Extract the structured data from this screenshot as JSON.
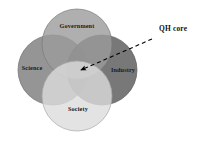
{
  "diagram": {
    "background_color": "#ffffff",
    "center": {
      "x": 77,
      "y": 70
    },
    "circle_radius": 35,
    "circles": [
      {
        "id": "government",
        "label": "Government",
        "position": "top",
        "cx": 77,
        "cy": 44,
        "r": 35,
        "fill": "#9b9b9b",
        "stroke": "#7a7a7a",
        "label_x": 77,
        "label_y": 27
      },
      {
        "id": "science",
        "label": "Science",
        "position": "left",
        "cx": 53,
        "cy": 70,
        "r": 35,
        "fill": "#8c8c8c",
        "stroke": "#6f6f6f",
        "label_x": 32,
        "label_y": 69
      },
      {
        "id": "industry",
        "label": "Industry",
        "position": "right",
        "cx": 102,
        "cy": 70,
        "r": 35,
        "fill": "#6d6d6d",
        "stroke": "#5a5a5a",
        "label_x": 123,
        "label_y": 71
      },
      {
        "id": "society",
        "label": "Society",
        "position": "bottom",
        "cx": 77,
        "cy": 96,
        "r": 35,
        "fill": "#dcdcdc",
        "stroke": "#a8a8a8",
        "label_x": 78,
        "label_y": 110
      }
    ],
    "annotation": {
      "id": "qh-core",
      "label": "QH core",
      "label_x": 159,
      "label_y": 29,
      "line_color": "#000000",
      "line_style": "dashed",
      "line_dash": "4,3",
      "line_width": 1.1,
      "line_start": {
        "x": 152,
        "y": 39
      },
      "line_end": {
        "x": 80,
        "y": 70
      },
      "arrow_tip": {
        "x": 77,
        "y": 71
      },
      "arrow_color": "#000000"
    }
  }
}
